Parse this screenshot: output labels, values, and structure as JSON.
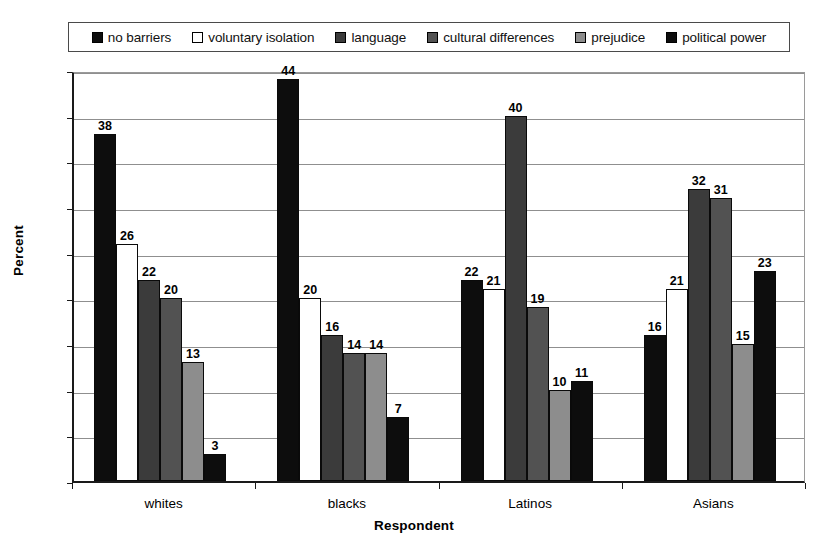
{
  "chart_data": {
    "type": "bar",
    "title": "",
    "xlabel": "Respondent",
    "ylabel": "Percent",
    "ylim": [
      0,
      45
    ],
    "ytick_step": 5,
    "yticks": [
      "0",
      "5",
      "10",
      "15",
      "20",
      "25",
      "30",
      "35",
      "40",
      "45"
    ],
    "grid": true,
    "legend_position": "top",
    "categories": [
      "whites",
      "blacks",
      "Latinos",
      "Asians"
    ],
    "series": [
      {
        "name": "no barriers",
        "color": "#0d0d0d",
        "values": [
          38,
          44,
          22,
          16
        ]
      },
      {
        "name": "voluntary isolation",
        "color": "#ffffff",
        "values": [
          26,
          20,
          21,
          21
        ]
      },
      {
        "name": "language",
        "color": "#3b3b3b",
        "values": [
          22,
          16,
          40,
          32
        ]
      },
      {
        "name": "cultural differences",
        "color": "#525252",
        "values": [
          20,
          14,
          19,
          31
        ]
      },
      {
        "name": "prejudice",
        "color": "#8d8d8d",
        "values": [
          13,
          14,
          10,
          15
        ]
      },
      {
        "name": "political power",
        "color": "#0d0d0d",
        "values": [
          3,
          7,
          11,
          23
        ]
      }
    ]
  },
  "legend": {
    "items": [
      {
        "label": "no barriers"
      },
      {
        "label": "voluntary isolation"
      },
      {
        "label": "language"
      },
      {
        "label": "cultural differences"
      },
      {
        "label": "prejudice"
      },
      {
        "label": "political power"
      }
    ]
  },
  "axes": {
    "y_title": "Percent",
    "x_title": "Respondent"
  }
}
